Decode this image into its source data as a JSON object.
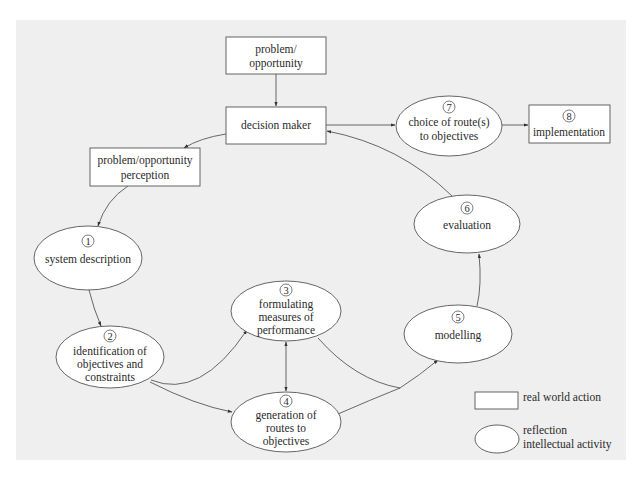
{
  "diagram": {
    "nodes": {
      "problem_opportunity": {
        "lines": [
          "problem/",
          "opportunity"
        ],
        "shape": "rect"
      },
      "decision_maker": {
        "lines": [
          "decision maker"
        ],
        "shape": "rect"
      },
      "perception": {
        "lines": [
          "problem/opportunity",
          "perception"
        ],
        "shape": "rect"
      },
      "n1": {
        "number": "1",
        "lines": [
          "system description"
        ],
        "shape": "ellipse"
      },
      "n2": {
        "number": "2",
        "lines": [
          "identification of",
          "objectives and",
          "constraints"
        ],
        "shape": "ellipse"
      },
      "n3": {
        "number": "3",
        "lines": [
          "formulating",
          "measures of",
          "performance"
        ],
        "shape": "ellipse"
      },
      "n4": {
        "number": "4",
        "lines": [
          "generation of",
          "routes to",
          "objectives"
        ],
        "shape": "ellipse"
      },
      "n5": {
        "number": "5",
        "lines": [
          "modelling"
        ],
        "shape": "ellipse"
      },
      "n6": {
        "number": "6",
        "lines": [
          "evaluation"
        ],
        "shape": "ellipse"
      },
      "n7": {
        "number": "7",
        "lines": [
          "choice of route(s)",
          "to objectives"
        ],
        "shape": "ellipse"
      },
      "n8": {
        "number": "8",
        "lines": [
          "implementation"
        ],
        "shape": "rect"
      }
    },
    "edges": [
      {
        "from": "problem_opportunity",
        "to": "decision_maker"
      },
      {
        "from": "decision_maker",
        "to": "perception"
      },
      {
        "from": "decision_maker",
        "to": "n7"
      },
      {
        "from": "n7",
        "to": "n8"
      },
      {
        "from": "perception",
        "to": "n1"
      },
      {
        "from": "n1",
        "to": "n2"
      },
      {
        "from": "n2",
        "to": "n3"
      },
      {
        "from": "n2",
        "to": "n4"
      },
      {
        "from": "n3",
        "to": "n4",
        "bidirectional": true
      },
      {
        "from": "n3",
        "to": "n5"
      },
      {
        "from": "n4",
        "to": "n5"
      },
      {
        "from": "n5",
        "to": "n6"
      },
      {
        "from": "n6",
        "to": "decision_maker"
      }
    ],
    "legend": {
      "rect_label": "real world action",
      "ellipse_label_1": "reflection",
      "ellipse_label_2": "intellectual activity"
    }
  }
}
